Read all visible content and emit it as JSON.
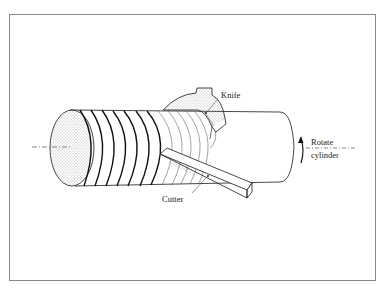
{
  "diagram": {
    "labels": {
      "knife": "Knife",
      "cutter": "Cutter",
      "rotate_line1": "Rotate",
      "rotate_line2": "cylinder"
    },
    "colors": {
      "line": "#1a1a1a",
      "frame": "#8a8a8a",
      "stipple": "#555555",
      "background": "#ffffff"
    }
  }
}
